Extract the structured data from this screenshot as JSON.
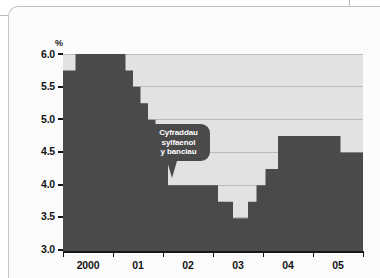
{
  "chart_data": {
    "type": "area",
    "title": "",
    "subtitle": "",
    "xlabel": "",
    "ylabel": "%",
    "unit_label": "%",
    "ylim": [
      3.0,
      6.0
    ],
    "xlim": [
      1999.75,
      2005.75
    ],
    "grid": true,
    "legend_position": "none",
    "series_name": "Cyfraddau sylfaenol y banciau",
    "y_ticks": [
      "3.0",
      "3.5",
      "4.0",
      "4.5",
      "5.0",
      "5.5",
      "6.0"
    ],
    "y_tick_values": [
      3.0,
      3.5,
      4.0,
      4.5,
      5.0,
      5.5,
      6.0
    ],
    "x_ticks": [
      "2000",
      "01",
      "02",
      "03",
      "04",
      "05"
    ],
    "x_tick_values": [
      2000,
      2001,
      2002,
      2003,
      2004,
      2005
    ],
    "step_interpolation": "step-post",
    "x": [
      1999.75,
      2000.0,
      2001.0,
      2001.15,
      2001.3,
      2001.45,
      2001.6,
      2001.72,
      2001.85,
      2002.0,
      2002.85,
      2003.15,
      2003.45,
      2003.62,
      2003.8,
      2004.05,
      2005.3,
      2005.75
    ],
    "values": [
      5.75,
      6.0,
      5.75,
      5.5,
      5.25,
      5.0,
      4.75,
      4.5,
      4.0,
      4.0,
      3.75,
      3.5,
      3.75,
      4.0,
      4.25,
      4.75,
      4.5,
      4.5
    ],
    "annotations": [
      {
        "name": "series-callout",
        "lines": [
          "Cyfraddau",
          "sylfaenol",
          "y banciau"
        ],
        "points_to_value": 4.0,
        "points_to_x": 2001.9
      }
    ],
    "colors": {
      "series_fill": "#4a4a4a",
      "plot_background": "#e2e2e2",
      "gridline": "#9a9a9a",
      "axis": "#161616",
      "callout_background": "#4a4a4a",
      "callout_text": "#ffffff",
      "page_background": "#fbfbfb"
    }
  },
  "axis": {
    "unit": "%",
    "y_labels": [
      "6.0",
      "5.5",
      "5.0",
      "4.5",
      "4.0",
      "3.5",
      "3.0"
    ],
    "x_labels": [
      "2000",
      "01",
      "02",
      "03",
      "04",
      "05"
    ]
  },
  "callout": {
    "line1": "Cyfraddau",
    "line2": "sylfaenol",
    "line3": "y banciau"
  }
}
